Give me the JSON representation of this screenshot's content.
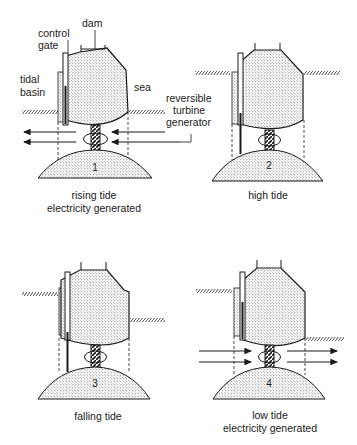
{
  "labels": {
    "dam": "dam",
    "control_gate_line1": "control",
    "control_gate_line2": "gate",
    "tidal_basin_line1": "tidal",
    "tidal_basin_line2": "basin",
    "sea": "sea",
    "turbine_line1": "reversible",
    "turbine_line2": "turbine",
    "turbine_line3": "generator"
  },
  "panels": [
    {
      "number": "1",
      "caption_line1": "rising tide",
      "caption_line2": "electricity generated",
      "flow": "right-to-left"
    },
    {
      "number": "2",
      "caption_line1": "high tide",
      "caption_line2": "",
      "flow": "none"
    },
    {
      "number": "3",
      "caption_line1": "falling tide",
      "caption_line2": "",
      "flow": "none"
    },
    {
      "number": "4",
      "caption_line1": "low tide",
      "caption_line2": "electricity generated",
      "flow": "left-to-right"
    }
  ],
  "colors": {
    "ink": "#1a1a1a",
    "stipple": "#555555",
    "background": "#ffffff"
  }
}
